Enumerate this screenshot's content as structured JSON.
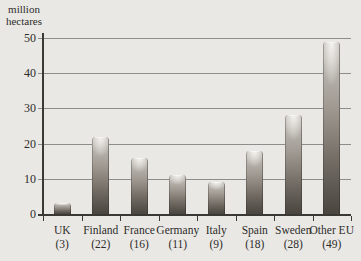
{
  "chart_data": {
    "type": "bar",
    "title": "",
    "unit_label_lines": [
      "million",
      "hectares"
    ],
    "categories": [
      "UK",
      "Finland",
      "France",
      "Germany",
      "Italy",
      "Spain",
      "Sweden",
      "Other EU"
    ],
    "values": [
      3,
      22,
      16,
      11,
      9,
      18,
      28,
      49
    ],
    "value_labels": [
      "(3)",
      "(22)",
      "(16)",
      "(11)",
      "(9)",
      "(18)",
      "(28)",
      "(49)"
    ],
    "ylabel": "million hectares",
    "xlabel": "",
    "ylim": [
      0,
      50
    ],
    "yticks": [
      0,
      10,
      20,
      30,
      40,
      50
    ],
    "grid": "horizontal",
    "legend": "none",
    "colors": {
      "background": "#e9e8e5",
      "gridline": "#8d8d8b",
      "axis": "#3b3935",
      "text": "#2e2c29",
      "bar_top": "#cac6c0",
      "bar_upper_mid": "#a39d96",
      "bar_lower_mid": "#6e6861",
      "bar_bottom": "#4a453f",
      "bar_highlight": "#f4f3f0"
    }
  }
}
